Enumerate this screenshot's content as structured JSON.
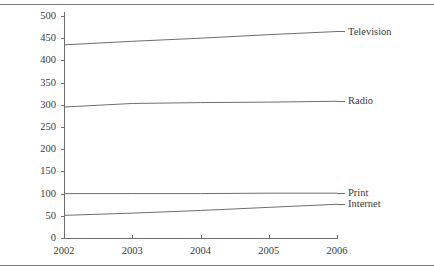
{
  "chart_data": {
    "type": "line",
    "title": "",
    "subtitle": "",
    "xlabel": "",
    "ylabel": "",
    "x": [
      2002,
      2003,
      2004,
      2005,
      2006
    ],
    "categories": [
      "2002",
      "2003",
      "2004",
      "2005",
      "2006"
    ],
    "xlim": [
      2002,
      2006
    ],
    "ylim": [
      0,
      500
    ],
    "yticks": [
      0,
      50,
      100,
      150,
      200,
      250,
      300,
      350,
      400,
      450,
      500
    ],
    "ytick_labels": [
      "0",
      "50",
      "100",
      "150",
      "200",
      "250",
      "300",
      "350",
      "400",
      "450",
      "500"
    ],
    "xticks": [
      2002,
      2003,
      2004,
      2005,
      2006
    ],
    "xtick_labels": [
      "2002",
      "2003",
      "2004",
      "2005",
      "2006"
    ],
    "grid": false,
    "legend_position": "right-inline-labels",
    "line_color": "#6e6e6e",
    "axis_color": "#6e6e6e",
    "series": [
      {
        "name": "Television",
        "values": [
          435,
          443,
          450,
          458,
          465
        ],
        "label": "Television",
        "color": "#6e6e6e"
      },
      {
        "name": "Radio",
        "values": [
          295,
          303,
          305,
          306,
          308
        ],
        "label": "Radio",
        "color": "#6e6e6e"
      },
      {
        "name": "Print",
        "values": [
          100,
          100,
          100,
          101,
          101
        ],
        "label": "Print",
        "color": "#6e6e6e"
      },
      {
        "name": "Internet",
        "values": [
          51,
          56,
          62,
          69,
          76
        ],
        "label": "Internet",
        "color": "#6e6e6e"
      }
    ]
  },
  "figure": {
    "top_rule": "",
    "bottom_rule": ""
  }
}
